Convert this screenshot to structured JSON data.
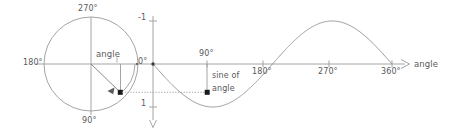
{
  "figure": {
    "colors": {
      "axis": "#9a9a9c",
      "curve": "#9a9a9c",
      "circle": "#9a9a9c",
      "text": "#59595b",
      "marker": "#1a1a1a",
      "dotted": "#9a9a9c"
    }
  },
  "circle_diagram": {
    "label_180": "180°",
    "label_270": "270°",
    "label_90": "90°",
    "label_angle": "angle",
    "center": {
      "x": 91,
      "y": 64
    },
    "radius": 47,
    "angle_deg": 35,
    "point": {
      "x": 120,
      "y": 92
    }
  },
  "sine_plot": {
    "y_axis": {
      "tick_minus_one": "-1",
      "tick_zero": "0°",
      "tick_one": "1"
    },
    "x_axis": {
      "ticks": [
        "90°",
        "180°",
        "270°",
        "360°"
      ],
      "axis_label": "angle"
    },
    "annotation": {
      "line1": "sine of",
      "line2": "angle"
    }
  },
  "chart_data": {
    "type": "line",
    "xlabel": "angle",
    "ylabel": "",
    "xlim": [
      0,
      360
    ],
    "ylim": [
      -1,
      1
    ],
    "y_inverted": true,
    "grid": false,
    "legend": null,
    "x_ticks": [
      90,
      180,
      270,
      360
    ],
    "x_tick_labels": [
      "90°",
      "180°",
      "270°",
      "360°"
    ],
    "y_ticks": [
      -1,
      0,
      1
    ],
    "y_tick_labels": [
      "-1",
      "0°",
      "1"
    ],
    "series": [
      {
        "name": "sine of angle",
        "function": "y = sin(angle), drawn with y axis pointing downward",
        "x": [
          0,
          30,
          60,
          90,
          120,
          150,
          180,
          210,
          240,
          270,
          300,
          330,
          360
        ],
        "values": [
          0,
          0.5,
          0.866,
          1,
          0.866,
          0.5,
          0,
          -0.5,
          -0.866,
          -1,
          -0.866,
          -0.5,
          0
        ]
      }
    ],
    "annotations": [
      {
        "text": "sine of angle",
        "x": 115,
        "y": 0.55
      },
      {
        "text": "angle",
        "x": 0,
        "y": 0,
        "target": "unit circle radius sweep"
      }
    ],
    "marked_points": [
      {
        "label": "point on circle",
        "x": 35,
        "y": 0.57
      },
      {
        "label": "point on sine curve",
        "x": 90,
        "y": 0.57
      }
    ]
  }
}
